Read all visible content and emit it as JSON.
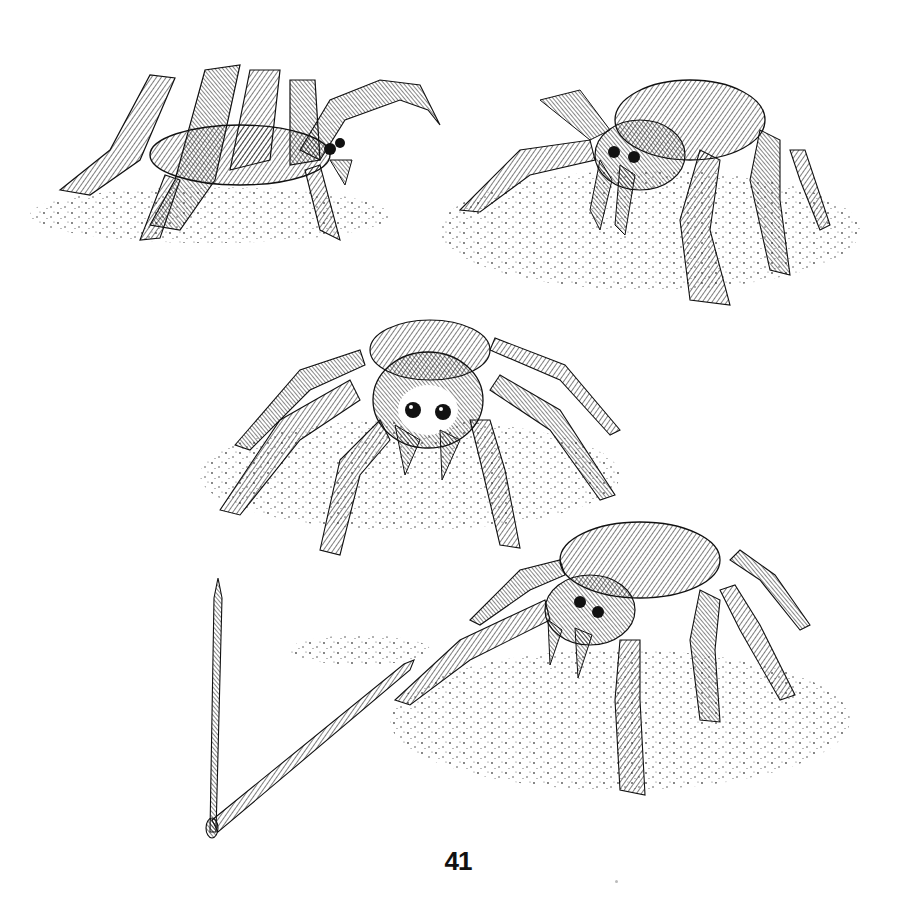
{
  "page": {
    "page_number": "41",
    "background": "#ffffff",
    "ink_color": "#111111"
  },
  "illustration": {
    "style": "pen-and-ink stippled hatching",
    "subjects": [
      {
        "name": "tarantula-side-view",
        "position": "top-left"
      },
      {
        "name": "tarantula-three-quarter-front",
        "position": "top-right"
      },
      {
        "name": "tarantula-frontal",
        "position": "center"
      },
      {
        "name": "tarantula-three-quarter-right",
        "position": "bottom-right"
      },
      {
        "name": "crossed-sticks",
        "position": "bottom-left"
      }
    ]
  }
}
